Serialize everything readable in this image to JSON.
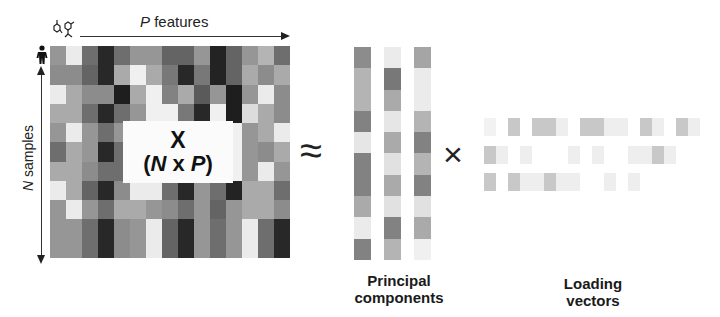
{
  "labels": {
    "p_features_var": "P",
    "p_features_text": " features",
    "n_samples_var": "N",
    "n_samples_text": " samples",
    "matrix_title": "X",
    "matrix_dims_open": "(",
    "matrix_dims_n": "N",
    "matrix_dims_x": " x ",
    "matrix_dims_p": "P",
    "matrix_dims_close": ")",
    "approx_symbol": "≈",
    "times_symbol": "×",
    "pc_label_line1": "Principal",
    "pc_label_line2": "components",
    "lv_label_line1": "Loading",
    "lv_label_line2": "vectors"
  },
  "icons": {
    "features": "molecule-icons",
    "samples": "person-icon"
  },
  "data_matrix": {
    "rows": 11,
    "cols": 15,
    "gray": [
      [
        150,
        235,
        110,
        40,
        110,
        150,
        150,
        100,
        100,
        150,
        35,
        100,
        150,
        180,
        110,
        150,
        235,
        170
      ],
      [
        140,
        140,
        100,
        40,
        170,
        240,
        170,
        120,
        40,
        120,
        35,
        100,
        170,
        140,
        170,
        80,
        235,
        140
      ],
      [
        235,
        170,
        140,
        140,
        30,
        170,
        240,
        130,
        170,
        90,
        150,
        30,
        150,
        235,
        140,
        40,
        120,
        140
      ],
      [
        170,
        170,
        110,
        40,
        110,
        150,
        240,
        240,
        120,
        40,
        240,
        30,
        220,
        170,
        140,
        40,
        150,
        150
      ],
      [
        150,
        235,
        150,
        110,
        150,
        240,
        240,
        240,
        240,
        240,
        240,
        240,
        150,
        170,
        235,
        110,
        150,
        235
      ],
      [
        110,
        170,
        150,
        40,
        110,
        240,
        240,
        240,
        240,
        240,
        240,
        240,
        150,
        140,
        170,
        110,
        170,
        110
      ],
      [
        170,
        170,
        140,
        110,
        110,
        240,
        240,
        240,
        240,
        240,
        240,
        240,
        150,
        235,
        150,
        40,
        110,
        140
      ],
      [
        235,
        170,
        100,
        40,
        140,
        235,
        235,
        110,
        40,
        150,
        110,
        35,
        170,
        170,
        110,
        100,
        170,
        110
      ],
      [
        150,
        235,
        150,
        110,
        170,
        170,
        150,
        140,
        110,
        150,
        100,
        150,
        170,
        170,
        140,
        110,
        140,
        150
      ],
      [
        150,
        150,
        110,
        40,
        140,
        150,
        235,
        100,
        40,
        150,
        110,
        150,
        235,
        110,
        40,
        150,
        150,
        170
      ],
      [
        150,
        150,
        110,
        40,
        140,
        150,
        235,
        100,
        40,
        150,
        110,
        150,
        235,
        110,
        40,
        150,
        150,
        170
      ]
    ]
  },
  "principal_components": {
    "columns": [
      [
        140,
        180,
        180,
        130,
        230,
        130,
        130,
        170,
        235,
        130
      ],
      [
        235,
        120,
        170,
        230,
        170,
        225,
        170,
        225,
        130,
        180
      ],
      [
        165,
        235,
        235,
        180,
        130,
        180,
        130,
        225,
        170,
        240
      ]
    ]
  },
  "loading_vectors": {
    "rows": [
      [
        242,
        255,
        200,
        255,
        200,
        200,
        238,
        255,
        200,
        200,
        238,
        238,
        255,
        200,
        238,
        255,
        200,
        238
      ],
      [
        200,
        238,
        255,
        238,
        255,
        255,
        255,
        238,
        255,
        238,
        255,
        255,
        238,
        238,
        200,
        238,
        255,
        255
      ],
      [
        200,
        255,
        200,
        238,
        238,
        200,
        238,
        238,
        255,
        255,
        238,
        255,
        238,
        255,
        255,
        255,
        255,
        255
      ]
    ]
  }
}
